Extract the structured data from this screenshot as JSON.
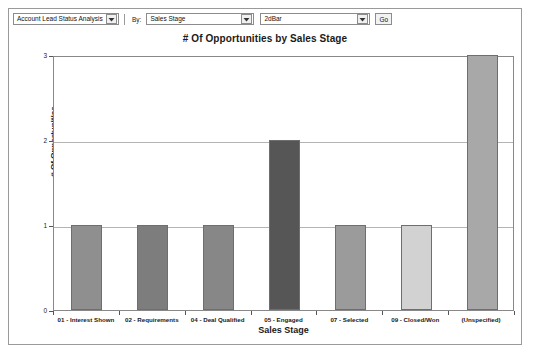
{
  "toolbar": {
    "report_select": {
      "value": "Account Lead Status Analysis",
      "icon": "chevron-down-icon"
    },
    "by_label": "By:",
    "groupby_select": {
      "value": "Sales Stage",
      "icon": "chevron-down-icon"
    },
    "charttype_select": {
      "value": "2dBar",
      "icon": "chevron-down-icon"
    },
    "go_button": "Go"
  },
  "chart_data": {
    "type": "bar",
    "title": "# Of Opportunities by Sales Stage",
    "xlabel": "Sales Stage",
    "ylabel": "# Of Opportunities",
    "categories": [
      "01 - Interest Shown",
      "02 - Requirements",
      "04 - Deal Qualified",
      "05 - Engaged",
      "07 - Selected",
      "09 - Closed/Won",
      "(Unspecified)"
    ],
    "values": [
      1,
      1,
      1,
      2,
      1,
      1,
      3
    ],
    "bar_colors": [
      "#8f8f8f",
      "#7d7d7d",
      "#878787",
      "#565656",
      "#9b9b9b",
      "#d2d2d2",
      "#a8a8a8"
    ],
    "ylim": [
      0,
      3
    ],
    "yticks": [
      0,
      1,
      2,
      3
    ],
    "ytick_labels": [
      "0",
      "1",
      "2",
      "3"
    ],
    "grid": true,
    "legend": "none"
  }
}
